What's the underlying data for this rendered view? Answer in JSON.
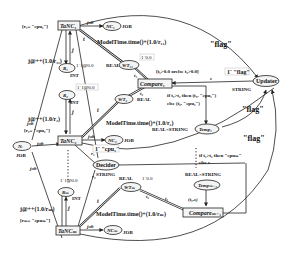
{
  "diagram": {
    "type": "colored-petri-net",
    "transitions": {
      "tanc1": "TaNC₁",
      "tanc2": "TaNC₂",
      "tancm": "TaNCₘ",
      "compare1": "Compare₁",
      "comparem1": "Compareₘ₋₁",
      "decider": "Decider",
      "updater": "Updater"
    },
    "places": {
      "nc1": "NC₁",
      "nc2": "NC₂",
      "ncm": "NCₘ",
      "wt1": "WT₁₁",
      "wt2": "WT₂",
      "wtm": "WTₘ",
      "r1": "R₁",
      "r2": "R₂",
      "rm": "Rₘ",
      "n": "Nᵢ",
      "temp1": "Temp₁",
      "tempm1": "Tempₘ₋₁"
    },
    "colorsets": {
      "job": "JOB",
      "int": "INT",
      "real": "REAL",
      "string": "STRING",
      "realxstring": "REAL×STRING"
    },
    "guards": {
      "g1": "[r₁= \"cpu₁\"]",
      "g2": "[r₂= \"cpu₂\"]",
      "gm": "[rₘ= \"cpuₘ\"]",
      "compare_guard": "[t₁>0.0 orelse t₂>0.0]"
    },
    "inscriptions": {
      "job": "job",
      "j": "j",
      "t": "t",
      "t1": "t₁",
      "t2": "t₂",
      "r1": "r₁",
      "r2": "r₂",
      "s": "s",
      "j_r1": "j@++(1.0/r₁₁)",
      "j_r2": "j@++(1.0/r₂)",
      "j_rm": "j@++(1.0/rₘ)",
      "model1": "ModelTime.time()+(1.0/r₁₁)",
      "model2": "ModelTime.time()+(1.0/r₂)",
      "modelm": "ModelTime.time()+(1.0/rₘ)",
      "if_cpu": "if t₁>t₂ then (t₁, \"cpu₁\")",
      "else_cpu": "else (t₂, \"cpu₂\")",
      "if_cpum": "if t₁>t₂ then \"cpuₘ\"",
      "else_s": "else s",
      "tuple": "(t₁,s)",
      "flag": "\"flag\""
    },
    "initial_markings": {
      "wt": "1`0.0",
      "r": "1`1@0.0",
      "updater": "1` \"flag\"",
      "decider": "1` \"cpu₁\""
    }
  }
}
